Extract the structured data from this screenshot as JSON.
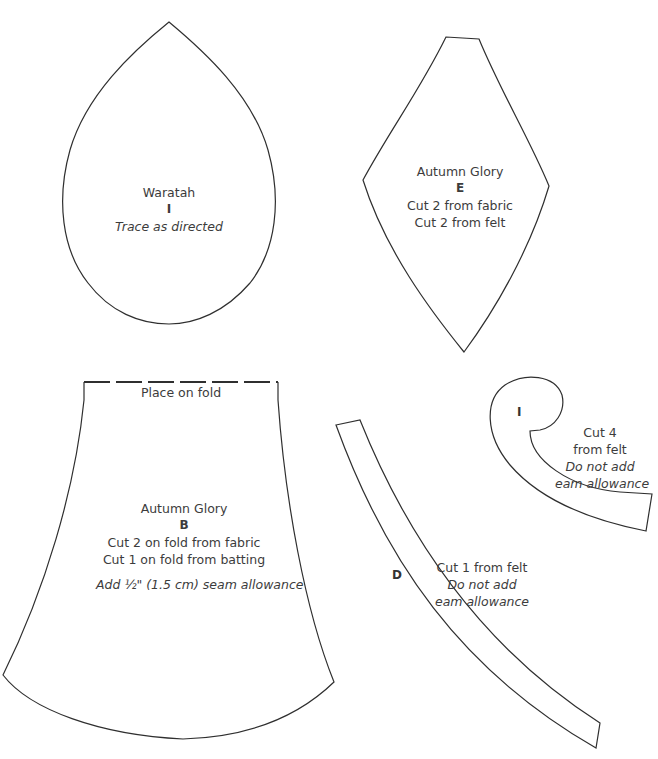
{
  "pieces": {
    "waratah": {
      "name": "Waratah",
      "letter": "I",
      "instruction": "Trace as directed"
    },
    "autumn_glory_e": {
      "name": "Autumn Glory",
      "letter": "E",
      "line1": "Cut 2 from fabric",
      "line2": "Cut 2 from felt"
    },
    "autumn_glory_b": {
      "fold_label": "Place on fold",
      "name": "Autumn Glory",
      "letter": "B",
      "line1": "Cut 2 on fold from fabric",
      "line2": "Cut 1 on fold from batting",
      "seam_note": "Add ½\" (1.5 cm) seam allowance"
    },
    "strip_d": {
      "letter": "D",
      "line1": "Cut 1 from felt",
      "line2": "Do not add",
      "line3": "eam allowance"
    },
    "curl_i": {
      "letter": "I",
      "line1": "Cut 4",
      "line2": "from felt",
      "line3": "Do not add",
      "line4": "eam allowance"
    }
  },
  "colors": {
    "outline": "#2f2f2f",
    "text": "#3c3c3c",
    "background": "#ffffff"
  }
}
